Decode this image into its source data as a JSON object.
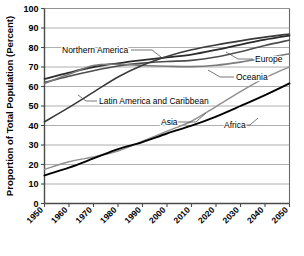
{
  "chart_data": {
    "type": "line",
    "title": "",
    "xlabel": "",
    "ylabel": "Proportion of Total Population (Percent)",
    "xlim": [
      1950,
      2050
    ],
    "ylim": [
      0,
      100
    ],
    "grid": true,
    "legend_position": "inline-labels",
    "x": [
      1950,
      1960,
      1970,
      1980,
      1990,
      2000,
      2010,
      2020,
      2030,
      2040,
      2050
    ],
    "xticklabels": [
      "1950",
      "1960",
      "1970",
      "1980",
      "1990",
      "2000",
      "2010",
      "2020",
      "2030",
      "2040",
      "2050"
    ],
    "yticklabels": [
      "0",
      "10",
      "20",
      "30",
      "40",
      "50",
      "60",
      "70",
      "80",
      "90",
      "100"
    ],
    "yticks": [
      0,
      10,
      20,
      30,
      40,
      50,
      60,
      70,
      80,
      90,
      100
    ],
    "series": [
      {
        "name": "Northern America",
        "color": "#2b2b2b",
        "width": 1.8,
        "label": "Northern America",
        "label_x": 62,
        "label_y": 53,
        "leader": [
          [
            131,
            50
          ],
          [
            152,
            50
          ],
          [
            161,
            57
          ]
        ],
        "values": [
          63.9,
          67.1,
          70.0,
          71.9,
          73.5,
          74.9,
          76.4,
          78.8,
          81.5,
          84.0,
          86.1
        ]
      },
      {
        "name": "Europe",
        "color": "#4d4d4d",
        "width": 1.6,
        "label": "Europe",
        "label_x": 255,
        "label_y": 62,
        "leader": [
          [
            253,
            59
          ],
          [
            238,
            59
          ],
          [
            226,
            52
          ]
        ],
        "values": [
          62.1,
          65.3,
          68.1,
          70.5,
          72.0,
          72.8,
          73.4,
          75.1,
          77.8,
          81.0,
          83.8
        ]
      },
      {
        "name": "Oceania",
        "color": "#7a7a7a",
        "width": 1.6,
        "label": "Oceania",
        "label_x": 236,
        "label_y": 80,
        "leader": [
          [
            234,
            77
          ],
          [
            220,
            77
          ],
          [
            208,
            70
          ]
        ],
        "values": [
          61.6,
          66.3,
          70.8,
          71.4,
          70.8,
          70.4,
          70.2,
          70.9,
          72.5,
          74.6,
          76.8
        ]
      },
      {
        "name": "Latin America and Caribbean",
        "color": "#3a3a3a",
        "width": 1.6,
        "label": "Latin America and Caribbean",
        "label_x": 99,
        "label_y": 104,
        "leader": [
          [
            97,
            101
          ],
          [
            86,
            101
          ],
          [
            78,
            95
          ]
        ],
        "values": [
          41.9,
          49.3,
          57.1,
          64.9,
          70.9,
          75.4,
          78.8,
          81.3,
          83.4,
          85.3,
          86.9
        ]
      },
      {
        "name": "Asia",
        "color": "#8f8f8f",
        "width": 1.5,
        "label": "Asia",
        "label_x": 161,
        "label_y": 125,
        "leader": [
          [
            176,
            122
          ],
          [
            196,
            122
          ],
          [
            206,
            113
          ]
        ],
        "values": [
          17.5,
          21.4,
          23.9,
          26.9,
          31.9,
          37.1,
          42.2,
          49.7,
          57.4,
          64.4,
          70.1
        ]
      },
      {
        "name": "Africa",
        "color": "#000000",
        "width": 1.9,
        "label": "Africa",
        "label_x": 224,
        "label_y": 128,
        "leader": [
          [
            239,
            125
          ],
          [
            250,
            125
          ],
          [
            258,
            118
          ]
        ],
        "values": [
          14.4,
          18.4,
          23.1,
          27.9,
          31.5,
          35.9,
          39.9,
          44.6,
          50.0,
          55.6,
          61.6
        ]
      }
    ]
  },
  "axis": {
    "y_axis_title": "Proportion of Total Population (Percent)"
  }
}
